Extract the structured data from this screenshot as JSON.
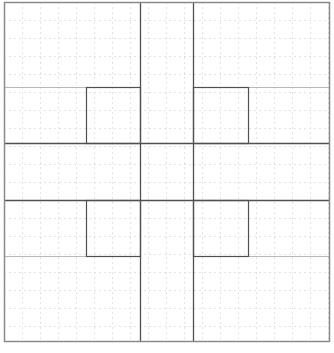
{
  "diagram": {
    "type": "grid-layout-sketch",
    "canvas": {
      "width": 334,
      "height": 353,
      "background": "#ffffff"
    },
    "colors": {
      "outer_border": "#8a8a8a",
      "thick_line": "#505050",
      "thin_line": "#b8b8b8",
      "grid_dash": "#e2e2e2"
    },
    "outer_frame": {
      "x": 4,
      "y": 2,
      "w": 325,
      "h": 339
    },
    "grid": {
      "spacing": 18,
      "dash": "2,3"
    },
    "vertical_dividers": [
      {
        "name": "left-column-divider",
        "x": 140,
        "y1": 2,
        "y2": 341
      },
      {
        "name": "right-column-divider",
        "x": 193,
        "y1": 2,
        "y2": 341
      }
    ],
    "horizontal_dividers": [
      {
        "name": "upper-band-divider",
        "y": 143,
        "x1": 4,
        "x2": 329
      },
      {
        "name": "lower-band-divider",
        "y": 200,
        "x1": 4,
        "x2": 329
      }
    ],
    "thin_lines": [
      {
        "name": "top-left-thin-line",
        "x1": 4,
        "y1": 87,
        "x2": 86,
        "y2": 87
      },
      {
        "name": "top-right-thin-line",
        "x1": 248,
        "y1": 87,
        "x2": 329,
        "y2": 87
      },
      {
        "name": "bottom-left-thin-line",
        "x1": 4,
        "y1": 256,
        "x2": 86,
        "y2": 256
      },
      {
        "name": "bottom-right-thin-line",
        "x1": 248,
        "y1": 256,
        "x2": 329,
        "y2": 256
      }
    ],
    "inner_boxes": [
      {
        "name": "inner-box-top-left",
        "x": 86,
        "y": 87,
        "w": 54,
        "h": 56
      },
      {
        "name": "inner-box-top-right",
        "x": 193,
        "y": 87,
        "w": 55,
        "h": 56
      },
      {
        "name": "inner-box-bottom-left",
        "x": 86,
        "y": 200,
        "w": 54,
        "h": 56
      },
      {
        "name": "inner-box-bottom-right",
        "x": 193,
        "y": 200,
        "w": 55,
        "h": 56
      }
    ]
  }
}
